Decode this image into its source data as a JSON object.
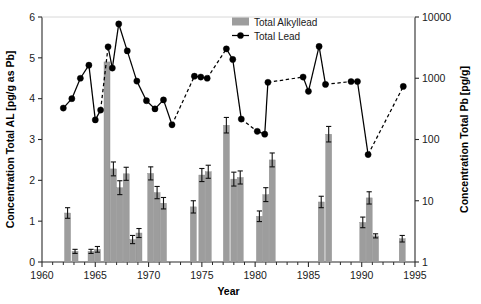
{
  "chart_data": {
    "type": "bar",
    "title": "",
    "xlabel": "Year",
    "ylabel": "Concentration Total AL [pg/g as Pb]",
    "y2label": "Concentration Total Pb [pg/g]",
    "xlim": [
      1960,
      1995
    ],
    "ylim": [
      0,
      6
    ],
    "y2lim": [
      1,
      10000
    ],
    "y2scale": "log",
    "grid": false,
    "legend_position": "top-center-right",
    "xticks": [
      1960,
      1965,
      1970,
      1975,
      1980,
      1985,
      1990,
      1995
    ],
    "xticklabels": [
      "1960",
      "1965",
      "1970",
      "1975",
      "1980",
      "1985",
      "1990",
      "1995"
    ],
    "xminorticks": [
      1961,
      1962,
      1963,
      1964,
      1966,
      1967,
      1968,
      1969,
      1971,
      1972,
      1973,
      1974,
      1976,
      1977,
      1978,
      1979,
      1981,
      1982,
      1983,
      1984,
      1986,
      1987,
      1988,
      1989,
      1991,
      1992,
      1993,
      1994
    ],
    "yticks": [
      0,
      1,
      2,
      3,
      4,
      5,
      6
    ],
    "yticklabels": [
      "0",
      "1",
      "2",
      "3",
      "4",
      "5",
      "6"
    ],
    "y2ticks": [
      1,
      10,
      100,
      1000,
      10000
    ],
    "y2ticklabels": [
      "1",
      "10",
      "100",
      "1000",
      "10000"
    ],
    "series": [
      {
        "name": "Total Alkyllead",
        "type": "bar",
        "axis": "left",
        "color": "#9d9d9d",
        "units": "pg/g as Pb",
        "points": [
          {
            "x": 1962.4,
            "y": 1.2,
            "err": 0.13
          },
          {
            "x": 1963.1,
            "y": 0.26,
            "err": 0.05
          },
          {
            "x": 1964.6,
            "y": 0.26,
            "err": 0.05
          },
          {
            "x": 1965.2,
            "y": 0.31,
            "err": 0.07
          },
          {
            "x": 1966.1,
            "y": 4.9,
            "err": 0.0
          },
          {
            "x": 1966.7,
            "y": 2.28,
            "err": 0.17
          },
          {
            "x": 1967.3,
            "y": 1.82,
            "err": 0.17
          },
          {
            "x": 1967.9,
            "y": 2.16,
            "err": 0.16
          },
          {
            "x": 1968.5,
            "y": 0.55,
            "err": 0.1
          },
          {
            "x": 1969.1,
            "y": 0.71,
            "err": 0.11
          },
          {
            "x": 1970.2,
            "y": 2.17,
            "err": 0.16
          },
          {
            "x": 1970.8,
            "y": 1.7,
            "err": 0.15
          },
          {
            "x": 1971.4,
            "y": 1.44,
            "err": 0.14
          },
          {
            "x": 1974.2,
            "y": 1.35,
            "err": 0.15
          },
          {
            "x": 1975.0,
            "y": 2.13,
            "err": 0.16
          },
          {
            "x": 1975.6,
            "y": 2.21,
            "err": 0.16
          },
          {
            "x": 1977.3,
            "y": 3.35,
            "err": 0.19
          },
          {
            "x": 1978.0,
            "y": 2.03,
            "err": 0.17
          },
          {
            "x": 1978.6,
            "y": 2.07,
            "err": 0.16
          },
          {
            "x": 1980.4,
            "y": 1.12,
            "err": 0.13
          },
          {
            "x": 1981.0,
            "y": 1.65,
            "err": 0.17
          },
          {
            "x": 1981.6,
            "y": 2.5,
            "err": 0.17
          },
          {
            "x": 1986.2,
            "y": 1.47,
            "err": 0.14
          },
          {
            "x": 1986.9,
            "y": 3.13,
            "err": 0.19
          },
          {
            "x": 1990.1,
            "y": 0.97,
            "err": 0.13
          },
          {
            "x": 1990.7,
            "y": 1.57,
            "err": 0.15
          },
          {
            "x": 1991.3,
            "y": 0.64,
            "err": 0.05
          },
          {
            "x": 1993.8,
            "y": 0.57,
            "err": 0.08
          }
        ]
      },
      {
        "name": "Total Lead",
        "type": "line-marker",
        "axis": "right",
        "color": "#000000",
        "units": "pg/g",
        "note": "y values listed on left-axis visual scale 0-6; right log axis value = 10^(y*(4/6)) approx",
        "points": [
          {
            "x": 1962.0,
            "y": 3.77,
            "link": "solid"
          },
          {
            "x": 1962.8,
            "y": 4.0,
            "link": "solid"
          },
          {
            "x": 1963.6,
            "y": 4.5,
            "link": "solid"
          },
          {
            "x": 1964.4,
            "y": 4.82,
            "link": "solid"
          },
          {
            "x": 1965.0,
            "y": 3.48,
            "link": "solid"
          },
          {
            "x": 1965.5,
            "y": 3.72,
            "link": "dashed"
          },
          {
            "x": 1966.2,
            "y": 5.27,
            "link": "solid"
          },
          {
            "x": 1966.6,
            "y": 4.75,
            "link": "solid"
          },
          {
            "x": 1967.2,
            "y": 5.83,
            "link": "solid"
          },
          {
            "x": 1968.0,
            "y": 5.17,
            "link": "solid"
          },
          {
            "x": 1968.9,
            "y": 4.43,
            "link": "solid"
          },
          {
            "x": 1969.8,
            "y": 3.95,
            "link": "solid"
          },
          {
            "x": 1970.6,
            "y": 3.75,
            "link": "solid"
          },
          {
            "x": 1971.4,
            "y": 3.97,
            "link": "solid"
          },
          {
            "x": 1972.2,
            "y": 3.36,
            "link": "dashed"
          },
          {
            "x": 1974.3,
            "y": 4.55,
            "link": "solid"
          },
          {
            "x": 1974.9,
            "y": 4.53,
            "link": "solid"
          },
          {
            "x": 1975.5,
            "y": 4.5,
            "link": "dashed"
          },
          {
            "x": 1977.3,
            "y": 5.22,
            "link": "solid"
          },
          {
            "x": 1977.9,
            "y": 4.96,
            "link": "solid"
          },
          {
            "x": 1978.7,
            "y": 3.5,
            "link": "dashed"
          },
          {
            "x": 1980.2,
            "y": 3.2,
            "link": "solid"
          },
          {
            "x": 1980.9,
            "y": 3.13,
            "link": "solid"
          },
          {
            "x": 1981.2,
            "y": 4.4,
            "link": "dashed"
          },
          {
            "x": 1984.5,
            "y": 4.53,
            "link": "solid"
          },
          {
            "x": 1985.0,
            "y": 4.18,
            "link": "solid"
          },
          {
            "x": 1986.0,
            "y": 5.28,
            "link": "solid"
          },
          {
            "x": 1986.6,
            "y": 4.35,
            "link": "dashed"
          },
          {
            "x": 1989.0,
            "y": 4.42,
            "link": "solid"
          },
          {
            "x": 1989.6,
            "y": 4.42,
            "link": "solid"
          },
          {
            "x": 1990.6,
            "y": 2.63,
            "link": "dashed"
          },
          {
            "x": 1993.9,
            "y": 4.3,
            "link": "end"
          }
        ]
      }
    ],
    "legend": [
      {
        "label": "Total Alkyllead",
        "marker": "bar",
        "color": "#9d9d9d"
      },
      {
        "label": "Total Lead",
        "marker": "line-circle",
        "color": "#000000"
      }
    ]
  }
}
